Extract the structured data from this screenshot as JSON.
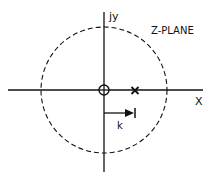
{
  "diagram": {
    "title": "Z-PLANE",
    "labels": {
      "imag_axis": "jy",
      "real_axis": "X",
      "arrow": "k"
    },
    "elements": {
      "unit_circle": {
        "style": "dashed",
        "cx": 104,
        "cy": 90,
        "r": 63
      },
      "zero": {
        "symbol": "o",
        "position": "origin"
      },
      "pole": {
        "symbol": "x",
        "position": "on real axis, inside unit circle"
      },
      "vector_k": {
        "from": "origin",
        "to": "pole real position",
        "style": "arrow with end bar"
      }
    },
    "colors": {
      "ink": "#111111",
      "background": "#ffffff"
    }
  }
}
